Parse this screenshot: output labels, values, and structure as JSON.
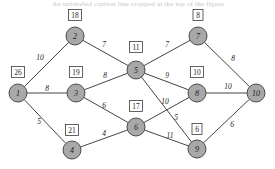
{
  "figure": {
    "caption_partial": "An unlabeled caption line cropped at the top of the figure",
    "background_color": "#ffffff",
    "node_fill_color": "#a8a8a8",
    "node_stroke_color": "#3c3c40",
    "edge_color": "#2f2f33",
    "box_fill_color": "#ffffff"
  },
  "graph": {
    "type": "weighted-undirected-network",
    "node_radius": 9,
    "nodes": [
      {
        "id": "1",
        "label": "1",
        "x": 18,
        "y": 93,
        "box_value": "26",
        "box_x": 18,
        "box_y": 72
      },
      {
        "id": "2",
        "label": "2",
        "x": 75,
        "y": 36,
        "box_value": "18",
        "box_x": 75,
        "box_y": 15
      },
      {
        "id": "3",
        "label": "3",
        "x": 76,
        "y": 93,
        "box_value": "19",
        "box_x": 76,
        "box_y": 72
      },
      {
        "id": "4",
        "label": "4",
        "x": 72,
        "y": 150,
        "box_value": "21",
        "box_x": 72,
        "box_y": 130
      },
      {
        "id": "5",
        "label": "5",
        "x": 136,
        "y": 70,
        "box_value": "11",
        "box_x": 136,
        "box_y": 47
      },
      {
        "id": "6",
        "label": "6",
        "x": 136,
        "y": 127,
        "box_value": "17",
        "box_x": 136,
        "box_y": 106
      },
      {
        "id": "7",
        "label": "7",
        "x": 198,
        "y": 36,
        "box_value": "8",
        "box_x": 198,
        "box_y": 15
      },
      {
        "id": "8",
        "label": "8",
        "x": 197,
        "y": 93,
        "box_value": "10",
        "box_x": 197,
        "box_y": 72
      },
      {
        "id": "9",
        "label": "9",
        "x": 197,
        "y": 149,
        "box_value": "6",
        "box_x": 197,
        "box_y": 129
      },
      {
        "id": "10",
        "label": "10",
        "x": 256,
        "y": 93,
        "box_value": null,
        "box_x": null,
        "box_y": null
      }
    ],
    "edges": [
      {
        "from": "1",
        "to": "2",
        "weight": "10",
        "label_x": 40,
        "label_y": 57
      },
      {
        "from": "1",
        "to": "3",
        "weight": "8",
        "label_x": 47,
        "label_y": 88
      },
      {
        "from": "1",
        "to": "4",
        "weight": "5",
        "label_x": 39,
        "label_y": 121
      },
      {
        "from": "2",
        "to": "5",
        "weight": "7",
        "label_x": 104,
        "label_y": 44
      },
      {
        "from": "3",
        "to": "5",
        "weight": "8",
        "label_x": 105,
        "label_y": 75
      },
      {
        "from": "3",
        "to": "6",
        "weight": "6",
        "label_x": 104,
        "label_y": 105
      },
      {
        "from": "4",
        "to": "6",
        "weight": "4",
        "label_x": 104,
        "label_y": 133
      },
      {
        "from": "5",
        "to": "7",
        "weight": "7",
        "label_x": 167,
        "label_y": 44
      },
      {
        "from": "5",
        "to": "8",
        "weight": "9",
        "label_x": 167,
        "label_y": 75
      },
      {
        "from": "5",
        "to": "9",
        "weight": "5",
        "label_x": 176,
        "label_y": 117
      },
      {
        "from": "6",
        "to": "8",
        "weight": "10",
        "label_x": 165,
        "label_y": 101
      },
      {
        "from": "6",
        "to": "9",
        "weight": "11",
        "label_x": 170,
        "label_y": 135
      },
      {
        "from": "7",
        "to": "10",
        "weight": "8",
        "label_x": 233,
        "label_y": 58
      },
      {
        "from": "8",
        "to": "10",
        "weight": "10",
        "label_x": 228,
        "label_y": 86
      },
      {
        "from": "9",
        "to": "10",
        "weight": "6",
        "label_x": 232,
        "label_y": 124
      }
    ]
  }
}
